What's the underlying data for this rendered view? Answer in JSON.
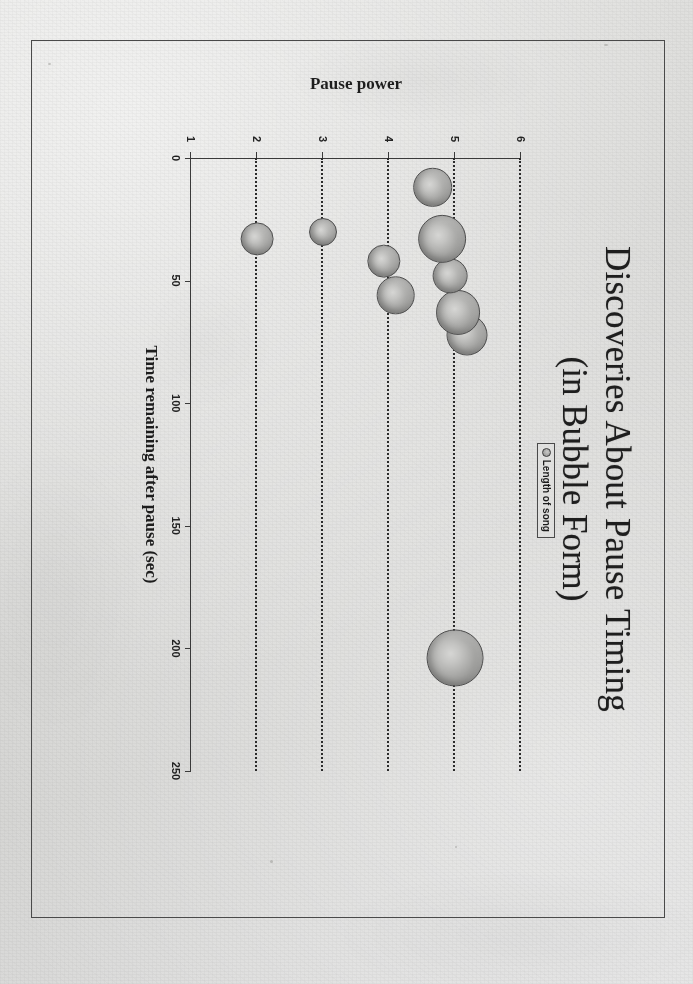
{
  "page": {
    "background_color": "#dcdcda",
    "frame_color": "#4a4a4a"
  },
  "slide": {
    "title_line1": "Discoveries About Pause Timing",
    "title_line2": "(in Bubble Form)"
  },
  "legend": {
    "marker_icon": "circle-marker-icon",
    "label": "Length of song"
  },
  "chart_data": {
    "type": "scatter",
    "title": "Discoveries About Pause Timing (in Bubble Form)",
    "xlabel": "Time remaining after pause (sec)",
    "ylabel": "Pause power",
    "xlim": [
      0,
      250
    ],
    "ylim": [
      1,
      6
    ],
    "xticks": [
      "0",
      "50",
      "100",
      "150",
      "200",
      "250"
    ],
    "xtick_values": [
      0,
      50,
      100,
      150,
      200,
      250
    ],
    "yticks": [
      "6",
      "5",
      "4",
      "3",
      "2",
      "1"
    ],
    "ytick_values": [
      6,
      5,
      4,
      3,
      2,
      1
    ],
    "grid": "dotted-horizontal-category-lines",
    "legend_position": "upper-center",
    "series": [
      {
        "name": "Length of song",
        "points": [
          {
            "x": 204,
            "y": 5.0,
            "size": 212
          },
          {
            "x": 72,
            "y": 5.18,
            "size": 150
          },
          {
            "x": 63,
            "y": 5.05,
            "size": 162
          },
          {
            "x": 48,
            "y": 4.93,
            "size": 128
          },
          {
            "x": 33,
            "y": 4.8,
            "size": 178
          },
          {
            "x": 12,
            "y": 4.66,
            "size": 140
          },
          {
            "x": 56,
            "y": 4.1,
            "size": 136
          },
          {
            "x": 42,
            "y": 3.92,
            "size": 118
          },
          {
            "x": 30,
            "y": 3.0,
            "size": 100
          },
          {
            "x": 33,
            "y": 2.0,
            "size": 120
          }
        ]
      }
    ]
  }
}
